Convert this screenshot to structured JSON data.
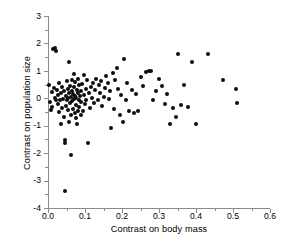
{
  "chart_data": {
    "type": "scatter",
    "title": "",
    "xlabel": "Contrast on body mass",
    "ylabel": "Contrast on population size",
    "xlim": [
      0.0,
      0.6
    ],
    "ylim": [
      -4,
      3
    ],
    "xticks": [
      0.0,
      0.1,
      0.2,
      0.3,
      0.4,
      0.5,
      0.6
    ],
    "xticklabels": [
      "0.0",
      "0.1",
      "0.2",
      "0.3",
      "0.4",
      "0.5",
      "0.6"
    ],
    "xticks_minor": [
      0.05,
      0.15,
      0.25,
      0.35,
      0.45,
      0.55
    ],
    "yticks": [
      3,
      2,
      1,
      0,
      -1,
      -2,
      -3,
      -4
    ],
    "yticklabels": [
      "3",
      "2",
      "1",
      "0",
      "-1",
      "-2",
      "-3",
      "-4"
    ],
    "grid": false,
    "legend": null,
    "marker": "filled-circle",
    "marker_color": "#0d0d0d",
    "marker_size_px": 4,
    "axis_color": "#8b8b8b",
    "background_color": "#ffffff",
    "n_points": 137,
    "points": [
      [
        0.004,
        0.5
      ],
      [
        0.006,
        -0.12
      ],
      [
        0.007,
        -0.42
      ],
      [
        0.01,
        0.22
      ],
      [
        0.012,
        -0.3
      ],
      [
        0.014,
        1.78
      ],
      [
        0.016,
        0.38
      ],
      [
        0.018,
        0.02
      ],
      [
        0.019,
        1.82
      ],
      [
        0.021,
        1.72
      ],
      [
        0.022,
        -0.05
      ],
      [
        0.024,
        0.3
      ],
      [
        0.026,
        -0.22
      ],
      [
        0.028,
        0.12
      ],
      [
        0.03,
        -0.5
      ],
      [
        0.031,
        0.55
      ],
      [
        0.033,
        -0.08
      ],
      [
        0.034,
        -0.95
      ],
      [
        0.036,
        0.18
      ],
      [
        0.038,
        -0.35
      ],
      [
        0.039,
        0.42
      ],
      [
        0.041,
        -0.02
      ],
      [
        0.042,
        -0.68
      ],
      [
        0.044,
        0.25
      ],
      [
        0.045,
        -1.52
      ],
      [
        0.046,
        -1.62
      ],
      [
        0.047,
        -3.38
      ],
      [
        0.048,
        0.08
      ],
      [
        0.049,
        -0.28
      ],
      [
        0.051,
        0.62
      ],
      [
        0.052,
        -0.05
      ],
      [
        0.053,
        0.34
      ],
      [
        0.054,
        -0.42
      ],
      [
        0.055,
        0.0
      ],
      [
        0.056,
        -0.85
      ],
      [
        0.057,
        1.32
      ],
      [
        0.058,
        0.2
      ],
      [
        0.059,
        -0.18
      ],
      [
        0.06,
        0.45
      ],
      [
        0.061,
        -0.62
      ],
      [
        0.062,
        0.05
      ],
      [
        0.063,
        -2.05
      ],
      [
        0.064,
        0.28
      ],
      [
        0.065,
        -0.1
      ],
      [
        0.066,
        0.68
      ],
      [
        0.067,
        -0.38
      ],
      [
        0.068,
        0.15
      ],
      [
        0.069,
        0.88
      ],
      [
        0.07,
        -0.02
      ],
      [
        0.071,
        0.4
      ],
      [
        0.072,
        -0.55
      ],
      [
        0.073,
        0.1
      ],
      [
        0.074,
        0.58
      ],
      [
        0.075,
        -0.25
      ],
      [
        0.076,
        0.02
      ],
      [
        0.077,
        -0.72
      ],
      [
        0.078,
        0.32
      ],
      [
        0.079,
        -0.92
      ],
      [
        0.08,
        0.18
      ],
      [
        0.081,
        -0.45
      ],
      [
        0.082,
        0.72
      ],
      [
        0.083,
        -0.05
      ],
      [
        0.084,
        0.48
      ],
      [
        0.085,
        -0.3
      ],
      [
        0.086,
        0.08
      ],
      [
        0.088,
        -0.6
      ],
      [
        0.089,
        0.25
      ],
      [
        0.09,
        -0.15
      ],
      [
        0.092,
        0.52
      ],
      [
        0.094,
        -0.48
      ],
      [
        0.096,
        0.12
      ],
      [
        0.098,
        0.85
      ],
      [
        0.1,
        -0.22
      ],
      [
        0.102,
        0.35
      ],
      [
        0.104,
        -0.05
      ],
      [
        0.106,
        0.65
      ],
      [
        0.108,
        -1.62
      ],
      [
        0.11,
        0.2
      ],
      [
        0.113,
        -0.35
      ],
      [
        0.116,
        0.42
      ],
      [
        0.119,
        0.02
      ],
      [
        0.122,
        0.55
      ],
      [
        0.125,
        -0.18
      ],
      [
        0.128,
        0.3
      ],
      [
        0.131,
        0.72
      ],
      [
        0.134,
        -0.08
      ],
      [
        0.137,
        0.48
      ],
      [
        0.14,
        0.18
      ],
      [
        0.143,
        0.62
      ],
      [
        0.146,
        -0.28
      ],
      [
        0.15,
        0.05
      ],
      [
        0.154,
        0.38
      ],
      [
        0.158,
        0.8
      ],
      [
        0.162,
        0.55
      ],
      [
        0.165,
        -0.02
      ],
      [
        0.168,
        0.25
      ],
      [
        0.171,
        -1.08
      ],
      [
        0.175,
        0.92
      ],
      [
        0.178,
        -0.4
      ],
      [
        0.182,
        0.68
      ],
      [
        0.186,
        1.1
      ],
      [
        0.19,
        0.35
      ],
      [
        0.194,
        -0.62
      ],
      [
        0.198,
        0.12
      ],
      [
        0.202,
        -0.88
      ],
      [
        0.206,
        1.42
      ],
      [
        0.21,
        -0.05
      ],
      [
        0.214,
        0.55
      ],
      [
        0.22,
        -0.45
      ],
      [
        0.226,
        0.3
      ],
      [
        0.232,
        -0.52
      ],
      [
        0.238,
        0.15
      ],
      [
        0.244,
        -0.48
      ],
      [
        0.252,
        0.78
      ],
      [
        0.258,
        0.45
      ],
      [
        0.265,
        0.95
      ],
      [
        0.272,
        1.0
      ],
      [
        0.278,
        0.98
      ],
      [
        0.285,
        -0.05
      ],
      [
        0.292,
        0.25
      ],
      [
        0.3,
        0.72
      ],
      [
        0.308,
        0.45
      ],
      [
        0.315,
        -0.22
      ],
      [
        0.322,
        0.15
      ],
      [
        0.33,
        -0.92
      ],
      [
        0.338,
        -0.35
      ],
      [
        0.345,
        -0.68
      ],
      [
        0.352,
        1.62
      ],
      [
        0.36,
        -0.25
      ],
      [
        0.368,
        0.48
      ],
      [
        0.378,
        -0.32
      ],
      [
        0.388,
        1.32
      ],
      [
        0.4,
        -0.95
      ],
      [
        0.432,
        1.62
      ],
      [
        0.472,
        0.68
      ],
      [
        0.508,
        0.35
      ],
      [
        0.512,
        -0.18
      ]
    ]
  },
  "axes": {
    "x_title": "Contrast on body mass",
    "y_title": "Contrast on population size"
  }
}
